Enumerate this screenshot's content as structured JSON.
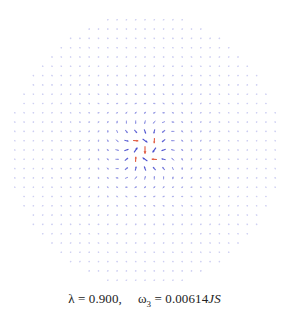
{
  "figure": {
    "type": "vector-field",
    "grid": {
      "spacing_px": 9.3,
      "center_px": [
        145,
        150
      ],
      "radius_px": 136
    },
    "colors": {
      "arrow_primary": "#4a4fd0",
      "arrow_highlight": "#e0553a",
      "background": "#ffffff"
    }
  },
  "caption": {
    "lambda_label": "λ = 0.900,",
    "omega_symbol": "ω",
    "omega_subscript": "3",
    "omega_value": " = 0.00614",
    "omega_unit": "JS"
  }
}
